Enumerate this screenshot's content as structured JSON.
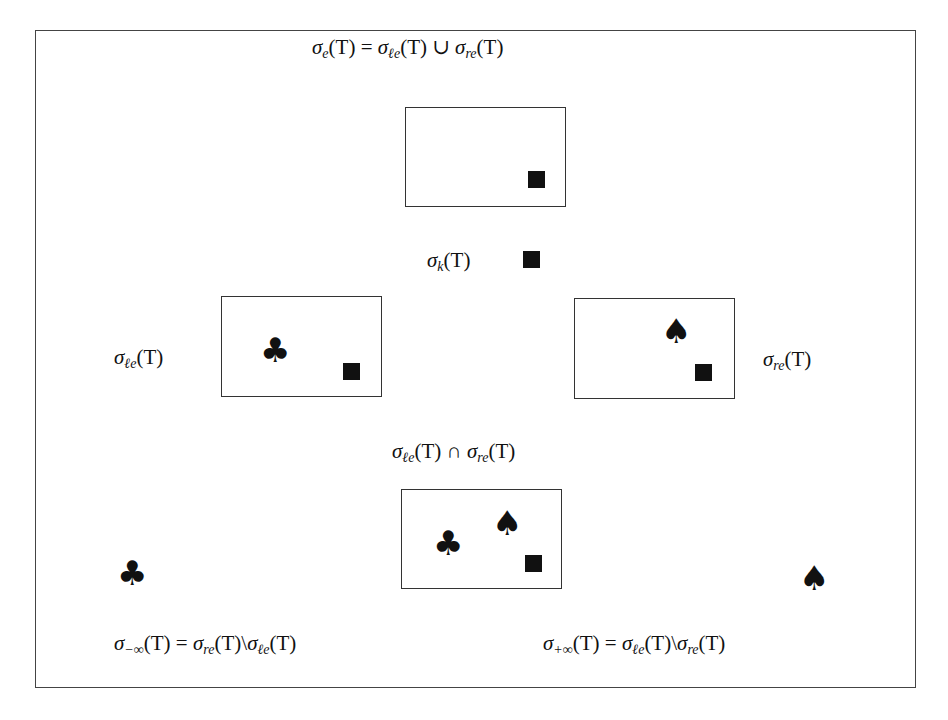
{
  "diagram": {
    "labels": {
      "essential": {
        "sigma": "σ",
        "sub": "e",
        "arg": "(T) = ",
        "rhs1_sigma": "σ",
        "rhs1_sub": "ℓe",
        "rhs1_arg": "(T) ∪ ",
        "rhs2_sigma": "σ",
        "rhs2_sub": "re",
        "rhs2_arg": "(T)",
        "full_text": "σ_e(T) = σ_ℓe(T) ∪ σ_re(T)"
      },
      "kernel": {
        "sigma": "σ",
        "sub": "k",
        "arg": "(T)",
        "full_text": "σ_k(T)"
      },
      "left_essential": {
        "sigma": "σ",
        "sub": "ℓe",
        "arg": "(T)",
        "full_text": "σ_ℓe(T)"
      },
      "right_essential": {
        "sigma": "σ",
        "sub": "re",
        "arg": "(T)",
        "full_text": "σ_re(T)"
      },
      "intersection": {
        "sigma1": "σ",
        "sub1": "ℓe",
        "arg1": "(T) ∩ ",
        "sigma2": "σ",
        "sub2": "re",
        "arg2": "(T)",
        "full_text": "σ_ℓe(T) ∩ σ_re(T)"
      },
      "minus_infinity": {
        "sigma": "σ",
        "sub": "−∞",
        "arg": "(T) = ",
        "rhs1_sigma": "σ",
        "rhs1_sub": "re",
        "rhs1_arg": "(T)\\",
        "rhs2_sigma": "σ",
        "rhs2_sub": "ℓe",
        "rhs2_arg": "(T)",
        "full_text": "σ_−∞(T) = σ_re(T)\\σ_ℓe(T)"
      },
      "plus_infinity": {
        "sigma": "σ",
        "sub": "+∞",
        "arg": "(T) = ",
        "rhs1_sigma": "σ",
        "rhs1_sub": "ℓe",
        "rhs1_arg": "(T)\\",
        "rhs2_sigma": "σ",
        "rhs2_sub": "re",
        "rhs2_arg": "(T)",
        "full_text": "σ_+∞(T) = σ_ℓe(T)\\σ_re(T)"
      }
    },
    "symbols": {
      "square": "■",
      "club": "♣",
      "spade": "♠"
    },
    "boxes": [
      {
        "name": "essential-box",
        "contains": [
          "square"
        ]
      },
      {
        "name": "left-essential-box",
        "contains": [
          "club",
          "square"
        ]
      },
      {
        "name": "right-essential-box",
        "contains": [
          "spade",
          "square"
        ]
      },
      {
        "name": "intersection-box",
        "contains": [
          "club",
          "spade",
          "square"
        ]
      }
    ],
    "colors": {
      "ink": "#111111",
      "border": "#333333",
      "background": "#ffffff"
    }
  }
}
